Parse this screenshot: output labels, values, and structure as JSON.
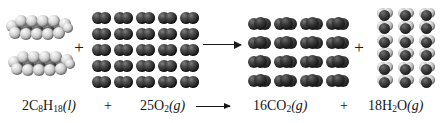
{
  "figure": {
    "background_color": "#ffffff"
  },
  "equation": {
    "reactant_1": {
      "coefficient": "2",
      "formula_parts": [
        {
          "text": "C",
          "sub": false
        },
        {
          "text": "8",
          "sub": true
        },
        {
          "text": "H",
          "sub": false
        },
        {
          "text": "18",
          "sub": true
        }
      ],
      "state": "(l)",
      "plain": "2C8H18(l)"
    },
    "plus_1": "+",
    "reactant_2": {
      "coefficient": "25",
      "formula_parts": [
        {
          "text": "O",
          "sub": false
        },
        {
          "text": "2",
          "sub": true
        }
      ],
      "state": "(g)",
      "plain": "25O2(g)"
    },
    "arrow": "⟶",
    "product_1": {
      "coefficient": "16",
      "formula_parts": [
        {
          "text": "CO",
          "sub": false
        },
        {
          "text": "2",
          "sub": true
        }
      ],
      "state": "(g)",
      "plain": "16CO2(g)"
    },
    "plus_2": "+",
    "product_2": {
      "coefficient": "18",
      "formula_parts": [
        {
          "text": "H",
          "sub": false
        },
        {
          "text": "2",
          "sub": true
        },
        {
          "text": "O",
          "sub": false
        }
      ],
      "state": "(g)",
      "plain": "18H2O(g)"
    }
  },
  "models": {
    "octane": {
      "label": "octane-molecule",
      "count": 2,
      "atom_color_light": "#dcdcdc",
      "atom_color_dark": "#3a3a3a",
      "description": "space-filling chain of light gray spheres"
    },
    "oxygen": {
      "label": "oxygen-molecule",
      "count": 25,
      "rows": 5,
      "columns": 5,
      "atom_color": "#262626",
      "description": "diatomic dark sphere pairs"
    },
    "carbon_dioxide": {
      "label": "carbon-dioxide-molecule",
      "count": 16,
      "rows": 4,
      "columns": 4,
      "atom_color": "#232323",
      "description": "linear three-atom dark molecules"
    },
    "water": {
      "label": "water-molecule",
      "count": 18,
      "rows": 6,
      "columns": 3,
      "oxygen_color": "#232323",
      "hydrogen_color": "#cfcfcf",
      "description": "bent molecules with dark oxygen and light hydrogens"
    }
  },
  "operators": {
    "plus_top_1": "+",
    "plus_top_2": "+"
  }
}
